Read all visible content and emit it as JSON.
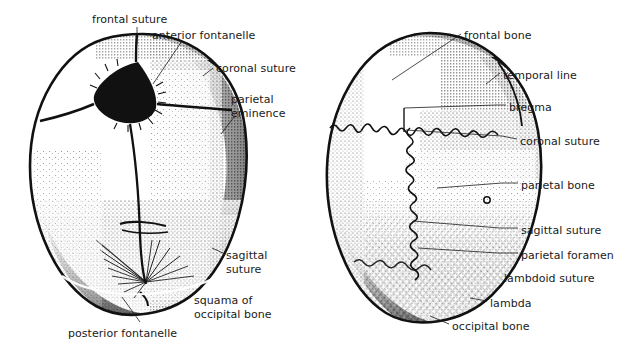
{
  "figure": {
    "background_color": "#ffffff",
    "ink_color": "#1a1a1a"
  },
  "left_diagram": {
    "name": "infant-skull-superior-view",
    "labels": [
      {
        "id": "frontal-suture",
        "text": "frontal suture",
        "x": 92,
        "y": 13
      },
      {
        "id": "anterior-fontanelle",
        "text": "anterior fontanelle",
        "x": 152,
        "y": 29
      },
      {
        "id": "coronal-suture",
        "text": "coronal suture",
        "x": 216,
        "y": 62
      },
      {
        "id": "parietal-eminence",
        "text": "parietal\neminence",
        "x": 231,
        "y": 93
      },
      {
        "id": "sagittal-suture",
        "text": "sagittal\nsuture",
        "x": 226,
        "y": 249
      },
      {
        "id": "squama-occipital",
        "text": "squama of\noccipital bone",
        "x": 194,
        "y": 294
      },
      {
        "id": "posterior-fontanelle",
        "text": "posterior fontanelle",
        "x": 68,
        "y": 327
      }
    ]
  },
  "right_diagram": {
    "name": "adult-skull-superior-view",
    "labels": [
      {
        "id": "frontal-bone",
        "text": "frontal bone",
        "x": 464,
        "y": 29
      },
      {
        "id": "temporal-line",
        "text": "temporal line",
        "x": 503,
        "y": 69
      },
      {
        "id": "bregma",
        "text": "bregma",
        "x": 509,
        "y": 101
      },
      {
        "id": "coronal-suture-r",
        "text": "coronal suture",
        "x": 520,
        "y": 135
      },
      {
        "id": "parietal-bone",
        "text": "parietal bone",
        "x": 521,
        "y": 179
      },
      {
        "id": "sagittal-suture-r",
        "text": "sagittal suture",
        "x": 521,
        "y": 224
      },
      {
        "id": "parietal-foramen",
        "text": "parietal foramen",
        "x": 521,
        "y": 249
      },
      {
        "id": "lambdoid-suture",
        "text": "lambdoid suture",
        "x": 504,
        "y": 272
      },
      {
        "id": "lambda",
        "text": "lambda",
        "x": 490,
        "y": 297
      },
      {
        "id": "occipital-bone",
        "text": "occipital bone",
        "x": 452,
        "y": 320
      }
    ]
  }
}
